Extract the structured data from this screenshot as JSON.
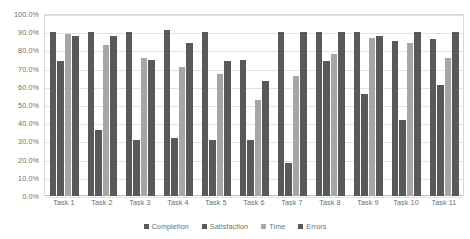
{
  "chart_data": {
    "type": "bar",
    "title": "",
    "subtitle": "",
    "xlabel": "",
    "ylabel": "",
    "ylim": [
      0,
      100
    ],
    "grid": true,
    "legend_position": "bottom",
    "categories": [
      "Task 1",
      "Task 2",
      "Task 3",
      "Task 4",
      "Task 5",
      "Task 6",
      "Task 7",
      "Task 8",
      "Task 9",
      "Task 10",
      "Task 11"
    ],
    "ytick_labels": [
      "100.0%",
      "90.0%",
      "80.0%",
      "70.0%",
      "60.0%",
      "50.0%",
      "40.0%",
      "30.0%",
      "20.0%",
      "10.0%",
      "0.0%"
    ],
    "ytick_values": [
      100,
      90,
      80,
      70,
      60,
      50,
      40,
      30,
      20,
      10,
      0
    ],
    "series": [
      {
        "name": "Completion",
        "color": "#595959",
        "values": [
          90,
          90,
          90,
          91,
          90,
          75,
          90,
          90,
          90,
          85,
          86
        ]
      },
      {
        "name": "Satisfaction",
        "color": "#595959",
        "values": [
          74,
          36,
          31,
          32,
          31,
          31,
          18,
          74,
          56,
          42,
          61
        ]
      },
      {
        "name": "Time",
        "color": "#a6a6a6",
        "values": [
          89,
          83,
          76,
          71,
          67,
          53,
          66,
          78,
          87,
          84,
          76
        ]
      },
      {
        "name": "Errors",
        "color": "#595959",
        "values": [
          88,
          88,
          75,
          84,
          74,
          63,
          90,
          90,
          88,
          90,
          90
        ]
      }
    ]
  }
}
